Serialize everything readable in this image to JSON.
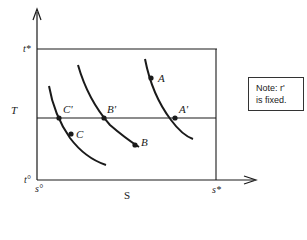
{
  "diagram": {
    "axes": {
      "y_label": "T",
      "x_label": "S",
      "y_top_tick": "t*",
      "y_origin_tick": "t°",
      "x_origin_tick": "s°",
      "x_right_tick": "s*"
    },
    "points": {
      "A": "A",
      "A_prime": "A'",
      "B": "B",
      "B_prime": "B'",
      "C": "C",
      "C_prime": "C'"
    },
    "note": {
      "line1": "Note: r'",
      "line2": "is fixed."
    },
    "colors": {
      "ink": "#1a1a1a",
      "background": "#ffffff"
    }
  }
}
